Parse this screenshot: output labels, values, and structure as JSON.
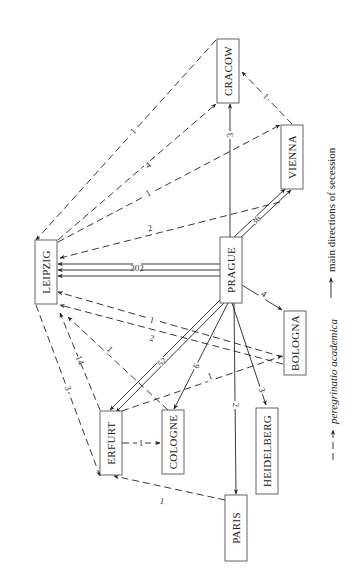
{
  "diagram": {
    "orientation": "rotated-90-ccw",
    "nodes": [
      {
        "id": "leipzig",
        "label": "LEIPZIG"
      },
      {
        "id": "prague",
        "label": "PRAGUE"
      },
      {
        "id": "cracow",
        "label": "CRACOW"
      },
      {
        "id": "vienna",
        "label": "VIENNA"
      },
      {
        "id": "erfurt",
        "label": "ERFURT"
      },
      {
        "id": "cologne",
        "label": "COLOGNE"
      },
      {
        "id": "bologna",
        "label": "BOLOGNA"
      },
      {
        "id": "heidelberg",
        "label": "HEIDELBERG"
      },
      {
        "id": "paris",
        "label": "PARIS"
      }
    ],
    "edges": [
      {
        "from": "prague",
        "to": "leipzig",
        "label": "302",
        "style": "secession"
      },
      {
        "from": "prague",
        "to": "erfurt",
        "label": "52",
        "style": "secession"
      },
      {
        "from": "prague",
        "to": "vienna",
        "label": "36",
        "style": "secession"
      },
      {
        "from": "prague",
        "to": "cologne",
        "label": "6",
        "style": "secession"
      },
      {
        "from": "prague",
        "to": "bologna",
        "label": "4",
        "style": "secession"
      },
      {
        "from": "prague",
        "to": "cracow",
        "label": "3",
        "style": "secession"
      },
      {
        "from": "prague",
        "to": "heidelberg",
        "label": "3",
        "style": "secession"
      },
      {
        "from": "prague",
        "to": "paris",
        "label": "2",
        "style": "secession"
      },
      {
        "from": "cracow",
        "to": "leipzig",
        "label": "1",
        "style": "peregrinatio"
      },
      {
        "from": "leipzig",
        "to": "cracow",
        "label": "4",
        "style": "peregrinatio"
      },
      {
        "from": "leipzig",
        "to": "vienna",
        "label": "1",
        "style": "peregrinatio"
      },
      {
        "from": "vienna",
        "to": "leipzig",
        "label": "2",
        "style": "peregrinatio"
      },
      {
        "from": "vienna",
        "to": "cracow",
        "label": "1",
        "style": "peregrinatio"
      },
      {
        "from": "bologna",
        "to": "leipzig",
        "label": "1",
        "style": "peregrinatio"
      },
      {
        "from": "bologna",
        "to": "leipzig",
        "label": "2",
        "style": "peregrinatio"
      },
      {
        "from": "erfurt",
        "to": "leipzig",
        "label": "14",
        "style": "peregrinatio"
      },
      {
        "from": "leipzig",
        "to": "erfurt",
        "label": "3",
        "style": "peregrinatio"
      },
      {
        "from": "cologne",
        "to": "leipzig",
        "label": "1",
        "style": "peregrinatio"
      },
      {
        "from": "erfurt",
        "to": "bologna",
        "label": "1",
        "style": "peregrinatio"
      },
      {
        "from": "erfurt",
        "to": "cologne",
        "label": "1",
        "style": "peregrinatio"
      },
      {
        "from": "paris",
        "to": "erfurt",
        "label": "1",
        "style": "peregrinatio"
      }
    ],
    "legend": [
      {
        "style": "secession",
        "label": "main directions of secession"
      },
      {
        "style": "peregrinatio",
        "label": "peregrinatio academica"
      }
    ]
  }
}
